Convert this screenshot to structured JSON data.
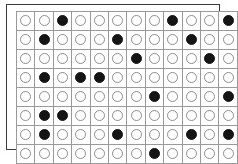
{
  "figure": {
    "rows": 8,
    "columns": 12,
    "token_empty_name": "empty-circle-icon",
    "token_filled_name": "filled-circle-icon"
  },
  "colors": {
    "page_background": "#ffffff",
    "frame_border": "#3a3a3a",
    "cell_border": "#9a9a9a",
    "cell_background": "#ffffff",
    "token_empty_outline": "#8d8d8d",
    "token_empty_fill": "#ffffff",
    "token_filled": "#151515"
  },
  "grid_data": {
    "type": "table",
    "rows": 8,
    "columns": 12,
    "legend": {
      "0": "empty circle",
      "1": "filled circle"
    },
    "filled_positions_by_row": {
      "row_1": [
        3,
        9,
        12
      ],
      "row_2": [
        2,
        6,
        10
      ],
      "row_3": [
        7,
        11
      ],
      "row_4": [
        2,
        4,
        5
      ],
      "row_5": [
        8,
        12
      ],
      "row_6": [
        2,
        3
      ],
      "row_7": [
        2,
        6,
        10,
        12
      ],
      "row_8": [
        8
      ]
    },
    "filled_count": 20,
    "empty_count": 76,
    "total_cells": 96,
    "matrix": [
      [
        0,
        0,
        1,
        0,
        0,
        0,
        0,
        0,
        1,
        0,
        0,
        1
      ],
      [
        0,
        1,
        0,
        0,
        0,
        1,
        0,
        0,
        0,
        1,
        0,
        0
      ],
      [
        0,
        0,
        0,
        0,
        0,
        0,
        1,
        0,
        0,
        0,
        1,
        0
      ],
      [
        0,
        1,
        0,
        1,
        1,
        0,
        0,
        0,
        0,
        0,
        0,
        0
      ],
      [
        0,
        0,
        0,
        0,
        0,
        0,
        0,
        1,
        0,
        0,
        0,
        1
      ],
      [
        0,
        1,
        1,
        0,
        0,
        0,
        0,
        0,
        0,
        0,
        0,
        0
      ],
      [
        0,
        1,
        0,
        0,
        0,
        1,
        0,
        0,
        0,
        1,
        0,
        1
      ],
      [
        0,
        0,
        0,
        0,
        0,
        0,
        0,
        1,
        0,
        0,
        0,
        0
      ]
    ]
  }
}
